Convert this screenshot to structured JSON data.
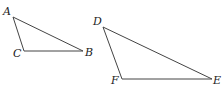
{
  "figure": {
    "stroke_color": "#444444",
    "label_color": "#222222",
    "triangles": [
      {
        "name": "ABC",
        "vertices": [
          {
            "label": "A",
            "x": 13,
            "y": 17,
            "lx": 3,
            "ly": 15
          },
          {
            "label": "B",
            "x": 83,
            "y": 51,
            "lx": 85,
            "ly": 56
          },
          {
            "label": "C",
            "x": 24,
            "y": 51,
            "lx": 13,
            "ly": 57
          }
        ]
      },
      {
        "name": "DEF",
        "vertices": [
          {
            "label": "D",
            "x": 103,
            "y": 27,
            "lx": 93,
            "ly": 25
          },
          {
            "label": "E",
            "x": 212,
            "y": 79,
            "lx": 213,
            "ly": 84
          },
          {
            "label": "F",
            "x": 122,
            "y": 79,
            "lx": 111,
            "ly": 84
          }
        ]
      }
    ]
  }
}
